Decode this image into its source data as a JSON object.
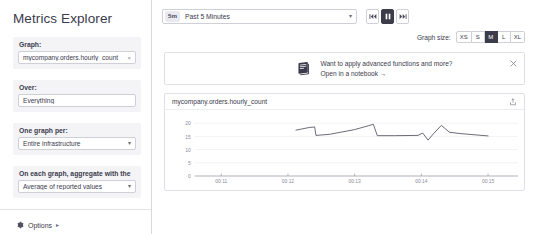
{
  "sidebar": {
    "title": "Metrics Explorer",
    "fields": [
      {
        "label": "Graph:",
        "value": "mycompany.orders.hourly_count",
        "remove": "×",
        "type": "tag"
      },
      {
        "label": "Over:",
        "value": "Everything",
        "type": "text"
      },
      {
        "label": "One graph per:",
        "value": "Entire infrastructure",
        "type": "select",
        "caret": "▾"
      },
      {
        "label": "On each graph, aggregate with the",
        "value": "Average of reported values",
        "type": "select",
        "caret": "▾"
      }
    ],
    "options": {
      "label": "Options",
      "arrow": "▸",
      "icon": "gear-icon"
    }
  },
  "toolbar": {
    "time": {
      "badge": "5m",
      "text": "Past 5 Minutes",
      "caret": "▾"
    },
    "playback": [
      {
        "name": "rewind",
        "active": false
      },
      {
        "name": "pause",
        "active": true
      },
      {
        "name": "forward",
        "active": false
      }
    ],
    "graph_size": {
      "label": "Graph size:",
      "options": [
        "XS",
        "S",
        "M",
        "L",
        "XL"
      ],
      "selected": "M"
    }
  },
  "banner": {
    "line1": "Want to apply advanced functions and more?",
    "line2": "Open in a notebook →",
    "icon": "notebook-icon",
    "close": "×"
  },
  "chart_data": {
    "type": "line",
    "title": "mycompany.orders.hourly_count",
    "xlabel": "",
    "ylabel": "",
    "grid": true,
    "legend": false,
    "ylim": [
      0,
      22
    ],
    "yticks": [
      0,
      5,
      10,
      15,
      20
    ],
    "xticks": [
      "00:11",
      "00:12",
      "00:13",
      "00:14",
      "00:15"
    ],
    "xlim": [
      "00:10:40",
      "00:15:40"
    ],
    "series": [
      {
        "name": "mycompany.orders.hourly_count",
        "color": "#5b5b6b",
        "x": [
          2.12,
          2.32,
          2.4,
          2.42,
          2.62,
          3.0,
          3.28,
          3.34,
          3.6,
          3.95,
          4.02,
          4.1,
          4.18,
          4.3,
          4.42,
          4.58,
          5.0
        ],
        "y": [
          17.4,
          18.4,
          18.6,
          15.4,
          15.8,
          17.6,
          19.6,
          15.3,
          15.3,
          15.4,
          16.3,
          13.6,
          16.0,
          19.2,
          16.6,
          16.1,
          15.2
        ]
      }
    ]
  }
}
